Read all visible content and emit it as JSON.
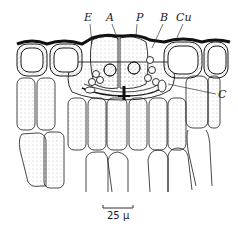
{
  "figure": {
    "labels": {
      "E": "E",
      "A": "A",
      "P": "P",
      "B": "B",
      "Cu": "Cu",
      "C": "C"
    },
    "scale_bar": {
      "label": "25 μ",
      "length_px": 30
    },
    "colors": {
      "ink": "#1a1a1a",
      "background": "#ffffff",
      "stipple": "#6b6b6b"
    }
  }
}
